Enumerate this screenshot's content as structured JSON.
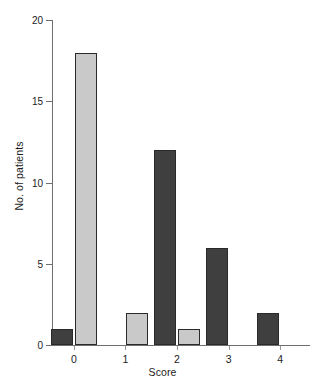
{
  "chart_data": {
    "type": "bar",
    "title": "",
    "xlabel": "Score",
    "ylabel": "No. of patients",
    "categories": [
      "0",
      "1",
      "2",
      "3",
      "4"
    ],
    "x_tick_labels": [
      "0",
      "1",
      "2",
      "3",
      "4"
    ],
    "y_tick_labels": [
      "0",
      "5",
      "10",
      "15",
      "20"
    ],
    "y_ticks": [
      0,
      5,
      10,
      15,
      20
    ],
    "ylim": [
      0,
      20
    ],
    "grid": false,
    "legend": false,
    "legend_position": "none",
    "series": [
      {
        "name": "dark",
        "color": "#3f3f3f",
        "values": [
          1,
          0,
          12,
          6,
          2
        ]
      },
      {
        "name": "light",
        "color": "#c9c9c9",
        "values": [
          18,
          2,
          1,
          0,
          0
        ]
      }
    ]
  },
  "axes": {
    "axis_color": "#6e6e6e",
    "bar_edge_color": "#2a2a2a",
    "background": "#ffffff"
  }
}
